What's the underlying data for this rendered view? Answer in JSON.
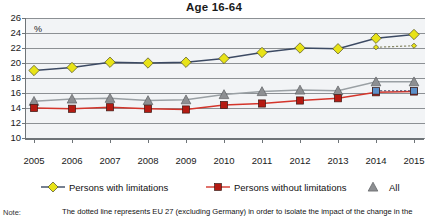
{
  "chart_data": {
    "type": "line",
    "title": "Age 16-64",
    "xlabel": "",
    "ylabel": "%",
    "ylim": [
      10,
      26
    ],
    "ytick_values": [
      26,
      24,
      22,
      20,
      18,
      16,
      14,
      12,
      10
    ],
    "grid": true,
    "legend_position": "bottom",
    "categories": [
      2005,
      2006,
      2007,
      2008,
      2009,
      2010,
      2011,
      2012,
      2013,
      2014,
      2015
    ],
    "series": [
      {
        "name": "Persons with limitations",
        "marker": "diamond",
        "color": "#e8e317",
        "line_color": "#3c4a63",
        "values": [
          19.0,
          19.4,
          20.1,
          20.0,
          20.1,
          20.6,
          21.4,
          22.0,
          21.9,
          23.3,
          23.8
        ]
      },
      {
        "name": "Persons without limitations",
        "marker": "square",
        "color": "#b51a12",
        "line_color": "#d4352b",
        "values": [
          14.0,
          13.9,
          14.1,
          13.9,
          13.8,
          14.4,
          14.6,
          15.0,
          15.3,
          16.1,
          16.2
        ]
      },
      {
        "name": "All",
        "marker": "triangle",
        "color": "#8d8f92",
        "line_color": "#9aa0a4",
        "values": [
          14.9,
          15.2,
          15.3,
          15.0,
          15.1,
          15.8,
          16.2,
          16.4,
          16.3,
          17.5,
          17.5
        ]
      }
    ],
    "dotted_series": [
      {
        "name": "Persons with limitations EU27 excluding Germany",
        "marker": "diamond-small",
        "color": "#e8e317",
        "x": [
          2014,
          2015
        ],
        "values": [
          22.1,
          22.3
        ]
      },
      {
        "name": "All EU27 excluding Germany",
        "marker": "square-small",
        "color": "#5b8fc9",
        "x": [
          2014,
          2015
        ],
        "values": [
          16.3,
          16.3
        ]
      }
    ],
    "annotations": []
  },
  "legend": {
    "items": [
      {
        "label": "Persons with limitations"
      },
      {
        "label": "Persons without limitations"
      },
      {
        "label": "All"
      }
    ]
  },
  "note": {
    "label": "Note:",
    "text": "The dotted line represents EU 27 (excluding Germany) in order to isolate the impact of the change in the"
  },
  "axis": {
    "y_ticks": [
      "26",
      "24",
      "22",
      "20",
      "18",
      "16",
      "14",
      "12",
      "10"
    ],
    "y_unit": "%",
    "x_ticks": [
      "2005",
      "2006",
      "2007",
      "2008",
      "2009",
      "2010",
      "2011",
      "2012",
      "2013",
      "2014",
      "2015"
    ]
  }
}
